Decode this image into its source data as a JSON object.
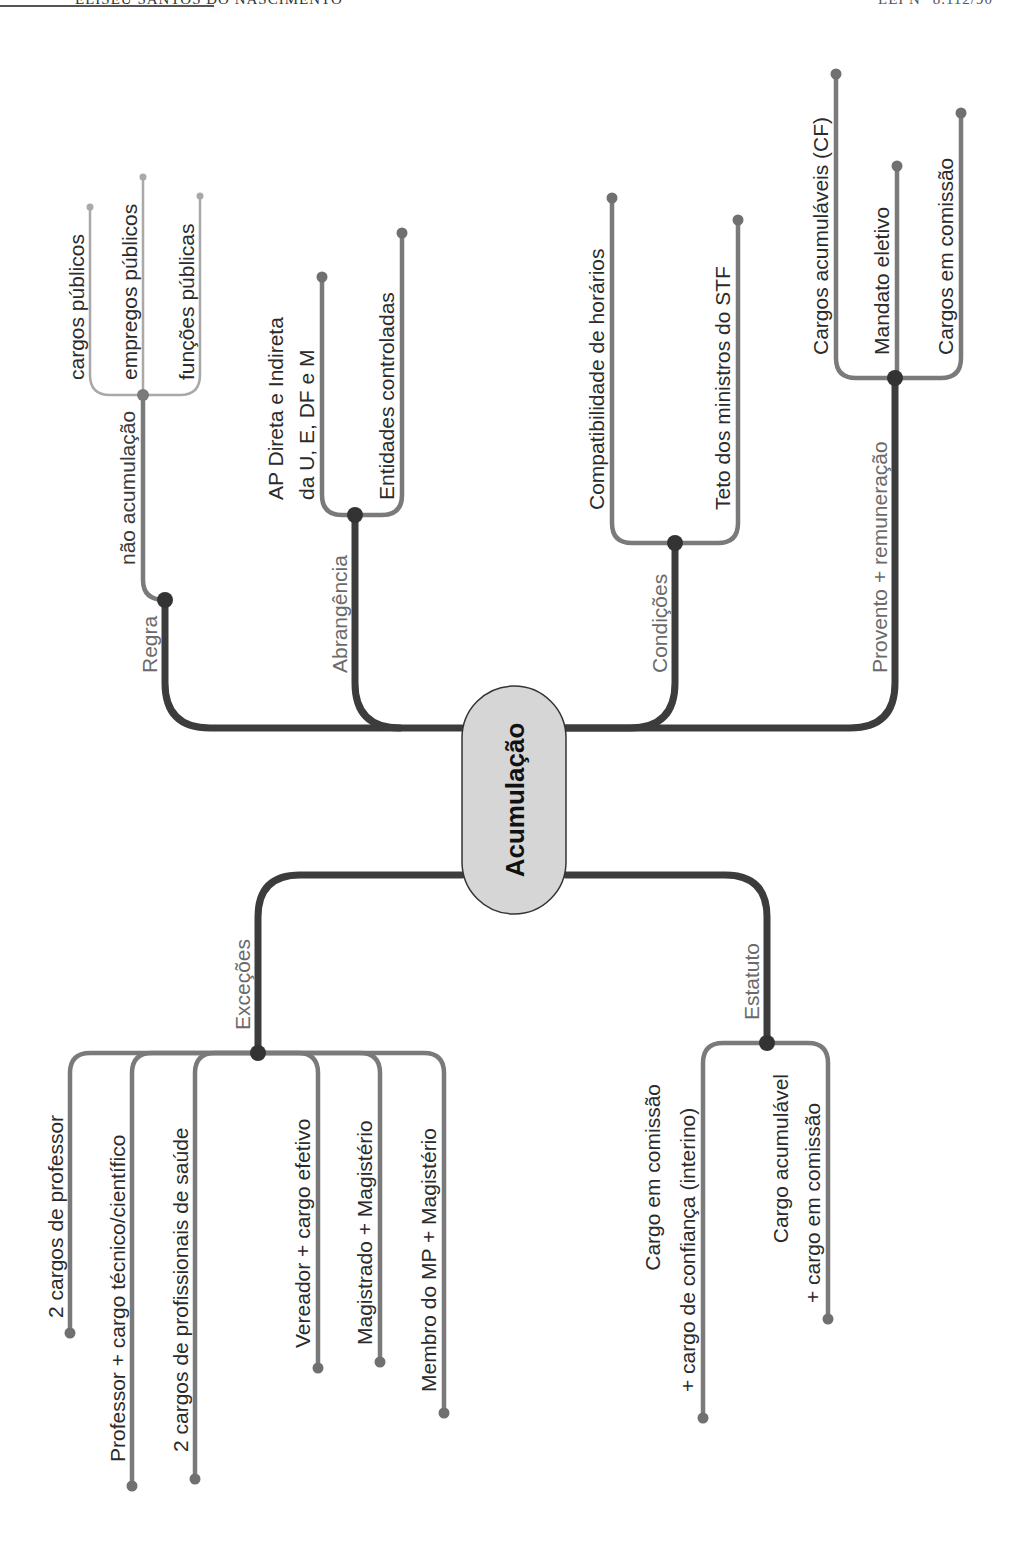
{
  "header": {
    "left": "ELISEU SANTOS DO NASCIMENTO",
    "right": "LEI N° 8.112/90"
  },
  "colors": {
    "trunk": "#3c3c3c",
    "branch": "#7a7a7a",
    "light_branch": "#a9a9a9",
    "node_fill": "#d6d6d6",
    "node_stroke": "#333333"
  },
  "mindmap": {
    "center": "Acumulação",
    "branches": [
      {
        "label": "Regra",
        "children": [
          {
            "label": "não acumulação",
            "children": [
              {
                "label": "cargos públicos"
              },
              {
                "label": "empregos públicos"
              },
              {
                "label": "funções públicas"
              }
            ]
          }
        ]
      },
      {
        "label": "Abrangência",
        "children": [
          {
            "label_line1": "AP Direta e Indireta",
            "label_line2": "da U, E, DF e M"
          },
          {
            "label": "Entidades controladas"
          }
        ]
      },
      {
        "label": "Condições",
        "children": [
          {
            "label": "Compatibilidade de horários"
          },
          {
            "label": "Teto dos ministros do STF"
          }
        ]
      },
      {
        "label": "Provento + remuneração",
        "children": [
          {
            "label": "Cargos acumuláveis (CF)"
          },
          {
            "label": "Mandato eletivo"
          },
          {
            "label": "Cargos em comissão"
          }
        ]
      },
      {
        "label": "Exceções",
        "children": [
          {
            "label": "2 cargos de professor"
          },
          {
            "label": "Professor + cargo técnico/científico"
          },
          {
            "label": "2 cargos de profissionais de saúde"
          },
          {
            "label": "Vereador + cargo efetivo"
          },
          {
            "label": "Magistrado + Magistério"
          },
          {
            "label": "Membro do MP + Magistério"
          }
        ]
      },
      {
        "label": "Estatuto",
        "children": [
          {
            "label_line1": "Cargo em comissão",
            "label_line2": "+ cargo de confiança (interino)"
          },
          {
            "label_line1": "Cargo acumulável",
            "label_line2": "+ cargo em comissão"
          }
        ]
      }
    ]
  }
}
